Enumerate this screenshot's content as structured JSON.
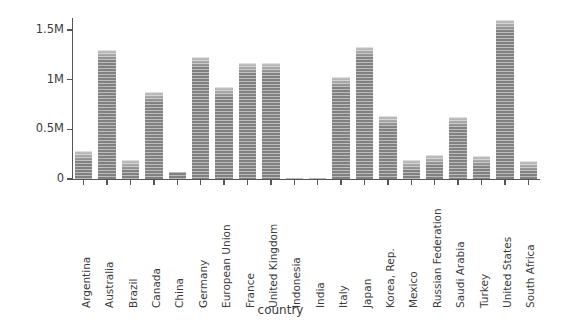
{
  "chart_data": {
    "type": "bar",
    "title": "",
    "xlabel": "country",
    "ylabel": "gnl_per_capita",
    "categories": [
      "Argentina",
      "Australia",
      "Brazil",
      "Canada",
      "China",
      "Germany",
      "European Union",
      "France",
      "United Kingdom",
      "Indonesia",
      "India",
      "Italy",
      "Japan",
      "Korea, Rep.",
      "Mexico",
      "Russian Federation",
      "Saudi Arabia",
      "Turkey",
      "United States",
      "South Africa"
    ],
    "values": [
      280000,
      1300000,
      190000,
      880000,
      70000,
      1230000,
      930000,
      1170000,
      1170000,
      12000,
      12000,
      1030000,
      1330000,
      630000,
      190000,
      240000,
      620000,
      230000,
      1600000,
      180000
    ],
    "ylim": [
      0,
      1620000
    ],
    "ytick_values": [
      0,
      500000,
      1000000,
      1500000
    ],
    "ytick_labels": [
      "0",
      "0.5M",
      "1M",
      "1.5M"
    ],
    "grid": false,
    "legend": null,
    "bar_color": "#8f8f8f"
  }
}
